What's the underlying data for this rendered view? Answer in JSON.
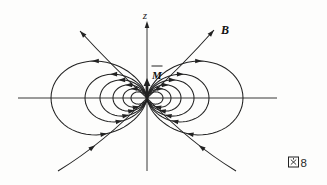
{
  "labels": {
    "z_axis": "z",
    "dipole_moment": "M",
    "dipole_notation": "overbar-vector",
    "field_b": "B"
  },
  "caption": {
    "full": "図8",
    "kanji": "図",
    "number": "8"
  },
  "colors": {
    "background": "#fdfdfc",
    "stroke": "#222222",
    "text": "#111111"
  },
  "diagram": {
    "type": "magnetic-dipole-field-lines",
    "center": {
      "x": 147,
      "y": 98
    },
    "axes": {
      "horizontal": {
        "x1": 18,
        "x2": 277,
        "y": 98
      },
      "vertical": {
        "x": 147,
        "y_top": 22,
        "y_bottom": 171
      }
    },
    "dipole_arrow": {
      "x": 147,
      "y_base": 98,
      "y_head": 78
    },
    "loops": {
      "L_values": [
        96,
        62,
        47,
        34,
        24,
        16
      ],
      "arrow_min_L": 22,
      "theta_top_arrow": 0.95,
      "theta_bottom_arrow": 2.27
    },
    "open_lines": [
      {
        "name": "upper-left-field-line",
        "p0": [
          147,
          98
        ],
        "c": [
          112,
          66
        ],
        "p1": [
          80,
          31
        ],
        "arrow": "end"
      },
      {
        "name": "upper-right-field-line",
        "p0": [
          147,
          98
        ],
        "c": [
          182,
          66
        ],
        "p1": [
          214,
          30
        ],
        "arrow": "end"
      },
      {
        "name": "lower-left-field-line",
        "p0": [
          58,
          171
        ],
        "c": [
          104,
          143
        ],
        "p1": [
          147,
          98
        ],
        "arrow": "mid",
        "t": 0.38
      },
      {
        "name": "lower-right-field-line",
        "p0": [
          236,
          171
        ],
        "c": [
          190,
          143
        ],
        "p1": [
          147,
          98
        ],
        "arrow": "mid",
        "t": 0.38
      }
    ]
  }
}
